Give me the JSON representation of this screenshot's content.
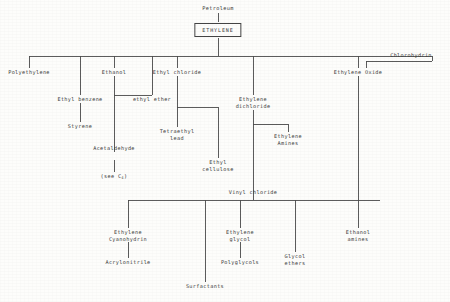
{
  "diagram": {
    "type": "process-flow-tree",
    "line_color": "#4a4a4a",
    "text_color": "#3a3a3a",
    "background": "#fdfdfb",
    "nodes": {
      "petroleum": "Petroleum",
      "ethylene": "ETHYLENE",
      "polyethylene": "Polyethylene",
      "ethyl_benzene": "Ethyl benzene",
      "styrene": "Styrene",
      "ethanol": "Ethanol",
      "ethyl_ether": "ethyl ether",
      "acetaldehyde": "Acetaldehyde",
      "see_c4_pre": "(see C",
      "see_c4_sub": "4",
      "see_c4_post": ")",
      "ethyl_chloride": "Ethyl chloride",
      "tetraethyl_lead_line1": "Tetraethyl",
      "tetraethyl_lead_line2": "lead",
      "ethyl_cellulose_line1": "Ethyl",
      "ethyl_cellulose_line2": "cellulose",
      "ethylene_dichloride_line1": "Ethylene",
      "ethylene_dichloride_line2": "dichloride",
      "ethylene_amines_line1": "Ethylene",
      "ethylene_amines_line2": "Amines",
      "vinyl_chloride": "Vinyl chloride",
      "ethylene_oxide": "Ethylene Oxide",
      "chlorohydrin": "Chlorohydrin",
      "ethylene_cyanohydrin_line1": "Ethylene",
      "ethylene_cyanohydrin_line2": "Cyanohydrin",
      "acrylonitrile": "Acrylonitrile",
      "surfactants": "Surfactants",
      "ethylene_glycol_line1": "Ethylene",
      "ethylene_glycol_line2": "glycol",
      "polyglycols": "Polyglycols",
      "glycol_ethers_line1": "Glycol",
      "glycol_ethers_line2": "ethers",
      "ethanol_amines_line1": "Ethanol",
      "ethanol_amines_line2": "amines"
    }
  }
}
